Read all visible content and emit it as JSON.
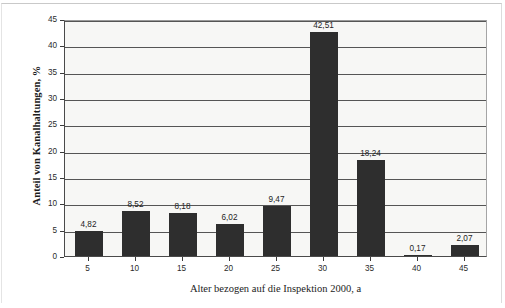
{
  "chart_data": {
    "type": "bar",
    "title": "",
    "xlabel": "Alter bezogen auf die Inspektion 2000, a",
    "ylabel": "Anteil von Kanalhaltungen, %",
    "categories": [
      "5",
      "10",
      "15",
      "20",
      "25",
      "30",
      "35",
      "40",
      "45"
    ],
    "values": [
      4.82,
      8.52,
      8.18,
      6.02,
      9.47,
      42.51,
      18.24,
      0.17,
      2.07
    ],
    "value_labels": [
      "4,82",
      "8,52",
      "8,18",
      "6,02",
      "9,47",
      "42,51",
      "18,24",
      "0,17",
      "2,07"
    ],
    "ylim": [
      0,
      45
    ],
    "ytick_labels": [
      "0",
      "5",
      "10",
      "15",
      "20",
      "25",
      "30",
      "35",
      "40",
      "45"
    ],
    "ytick_values": [
      0,
      5,
      10,
      15,
      20,
      25,
      30,
      35,
      40,
      45
    ],
    "grid": "horizontal",
    "legend": "none",
    "bar_color": "#2e2e2e",
    "plot_background": "#f7f7f5",
    "axis_color": "#4a4a4a"
  }
}
